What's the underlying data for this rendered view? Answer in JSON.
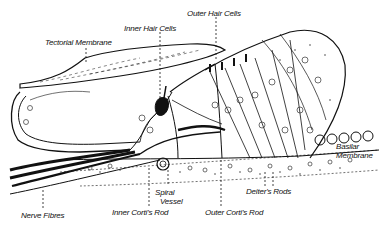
{
  "diagram": {
    "labels": {
      "tectorial_membrane": "Tectorial Membrane",
      "inner_hair_cells": "Inner Hair Cells",
      "outer_hair_cells": "Outer Hair Cells",
      "basilar_membrane_1": "Basilar",
      "basilar_membrane_2": "Membrane",
      "nerve_fibres": "Nerve Fibres",
      "spiral_vessel_1": "Spiral",
      "spiral_vessel_2": "Vessel",
      "inner_cortis_rod": "Inner Corti's Rod",
      "outer_cortis_rod": "Outer Corti's Rod",
      "deiters_rods": "Deiter's Rods"
    },
    "colors": {
      "ink": "#111111",
      "background": "#ffffff",
      "stipple": "#333333"
    }
  }
}
